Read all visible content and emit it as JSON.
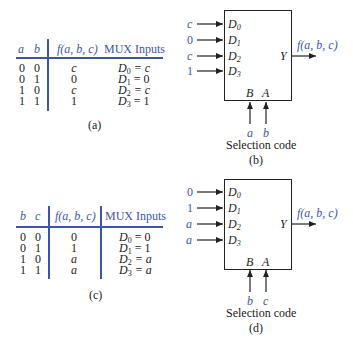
{
  "colors": {
    "accent": "#3d55a6",
    "ink": "#222222"
  },
  "table_a": {
    "headers": [
      "a",
      "b",
      "f(a, b, c)",
      "MUX Inputs"
    ],
    "rows": [
      {
        "a": "0",
        "b": "0",
        "f": "c",
        "d": "D",
        "sub": "0",
        "val": "= c"
      },
      {
        "a": "0",
        "b": "1",
        "f": "0",
        "d": "D",
        "sub": "1",
        "val": "= 0"
      },
      {
        "a": "1",
        "b": "0",
        "f": "c",
        "d": "D",
        "sub": "2",
        "val": "= c"
      },
      {
        "a": "1",
        "b": "1",
        "f": "1",
        "d": "D",
        "sub": "3",
        "val": "= 1"
      }
    ],
    "caption": "(a)"
  },
  "table_c": {
    "headers": [
      "b",
      "c",
      "f(a, b, c)",
      "MUX Inputs"
    ],
    "rows": [
      {
        "a": "0",
        "b": "0",
        "f": "0",
        "d": "D",
        "sub": "0",
        "val": "= 0"
      },
      {
        "a": "0",
        "b": "1",
        "f": "1",
        "d": "D",
        "sub": "1",
        "val": "= 1"
      },
      {
        "a": "1",
        "b": "0",
        "f": "a",
        "d": "D",
        "sub": "2",
        "val": "= a"
      },
      {
        "a": "1",
        "b": "1",
        "f": "a",
        "d": "D",
        "sub": "3",
        "val": "= a"
      }
    ],
    "caption": "(c)"
  },
  "mux_b": {
    "inputs": [
      "c",
      "0",
      "c",
      "1"
    ],
    "pins": [
      {
        "d": "D",
        "sub": "0"
      },
      {
        "d": "D",
        "sub": "1"
      },
      {
        "d": "D",
        "sub": "2"
      },
      {
        "d": "D",
        "sub": "3"
      }
    ],
    "output_pin": "Y",
    "output_label": "f(a, b, c)",
    "select_pins": [
      "B",
      "A"
    ],
    "select_inputs": [
      "a",
      "b"
    ],
    "select_label": "Selection code",
    "caption": "(b)"
  },
  "mux_d": {
    "inputs": [
      "0",
      "1",
      "a",
      "a"
    ],
    "pins": [
      {
        "d": "D",
        "sub": "0"
      },
      {
        "d": "D",
        "sub": "1"
      },
      {
        "d": "D",
        "sub": "2"
      },
      {
        "d": "D",
        "sub": "3"
      }
    ],
    "output_pin": "Y",
    "output_label": "f(a, b, c)",
    "select_pins": [
      "B",
      "A"
    ],
    "select_inputs": [
      "b",
      "c"
    ],
    "select_label": "Selection code",
    "caption": "(d)"
  }
}
